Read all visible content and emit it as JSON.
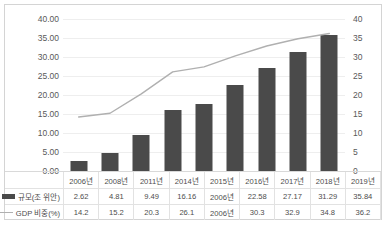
{
  "chart_data": {
    "type": "bar",
    "title": "",
    "xlabel": "",
    "ylabel": "",
    "grid": true,
    "legend_position": "table-left",
    "categories": [
      "2006년",
      "2008년",
      "2011년",
      "2014년",
      "2015년",
      "2016년",
      "2017년",
      "2018년",
      "2019년"
    ],
    "series": [
      {
        "name": "규모(조 위안)",
        "type": "bar",
        "axis": "left",
        "color": "#4a4a4a",
        "values": [
          2.62,
          4.81,
          9.49,
          16.16,
          17.74,
          22.58,
          27.17,
          31.29,
          35.84
        ],
        "labels": [
          "2.62",
          "4.81",
          "9.49",
          "16.16",
          "2006년",
          "22.58",
          "27.17",
          "31.29",
          "35.84"
        ]
      },
      {
        "name": "GDP 비중(%)",
        "type": "line",
        "axis": "right",
        "color": "#b0b0b0",
        "values": [
          14.2,
          15.2,
          20.3,
          26.1,
          27.4,
          30.3,
          32.9,
          34.8,
          36.2
        ],
        "labels": [
          "14.2",
          "15.2",
          "20.3",
          "26.1",
          "2006년",
          "30.3",
          "32.9",
          "34.8",
          "36.2"
        ]
      }
    ],
    "left_axis": {
      "min": 0,
      "max": 40,
      "step": 5,
      "ticks": [
        "0.00",
        "5.00",
        "10.00",
        "15.00",
        "20.00",
        "25.00",
        "30.00",
        "35.00",
        "40.00"
      ]
    },
    "right_axis": {
      "min": 0,
      "max": 40,
      "step": 5,
      "ticks": [
        "0",
        "5",
        "10",
        "15",
        "20",
        "25",
        "30",
        "35",
        "40"
      ]
    }
  }
}
